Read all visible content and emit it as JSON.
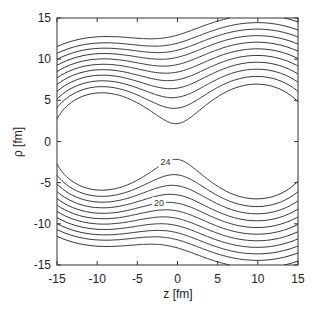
{
  "chart_data": {
    "type": "contour",
    "title": "",
    "xlabel": "z [fm]",
    "ylabel": "ρ [fm]",
    "xlim": [
      -15,
      15
    ],
    "ylim": [
      -15,
      15
    ],
    "xticks": [
      -15,
      -10,
      -5,
      0,
      5,
      10,
      15
    ],
    "yticks": [
      -15,
      -10,
      -5,
      0,
      5,
      10,
      15
    ],
    "grid": false,
    "legend": null,
    "centers": [
      {
        "z": -10,
        "rho": 0,
        "inner_radius_fm": 4.6
      },
      {
        "z": 10,
        "rho": 0,
        "inner_radius_fm": 5.8
      }
    ],
    "contour_levels_count": 11,
    "contour_labels": [
      {
        "text": "24",
        "z": -1.5,
        "rho": -2.5
      },
      {
        "text": "20",
        "z": -2.3,
        "rho": -7.5
      }
    ],
    "outer_contour_extent": {
      "rho_max_left": 7.8,
      "rho_max_right": 10.2,
      "rho_min_left": -7.8,
      "rho_min_right": -10.2
    }
  },
  "model": {
    "left": {
      "z": -10,
      "amp": 1.0,
      "width": 6.2
    },
    "right": {
      "z": 10,
      "amp": 1.0,
      "width": 7.6
    },
    "levels": [
      0.13,
      0.165,
      0.2,
      0.24,
      0.285,
      0.335,
      0.39,
      0.45,
      0.515,
      0.585,
      0.66
    ]
  },
  "frame": {
    "left": 57,
    "top": 18,
    "right": 298,
    "bottom": 265
  }
}
